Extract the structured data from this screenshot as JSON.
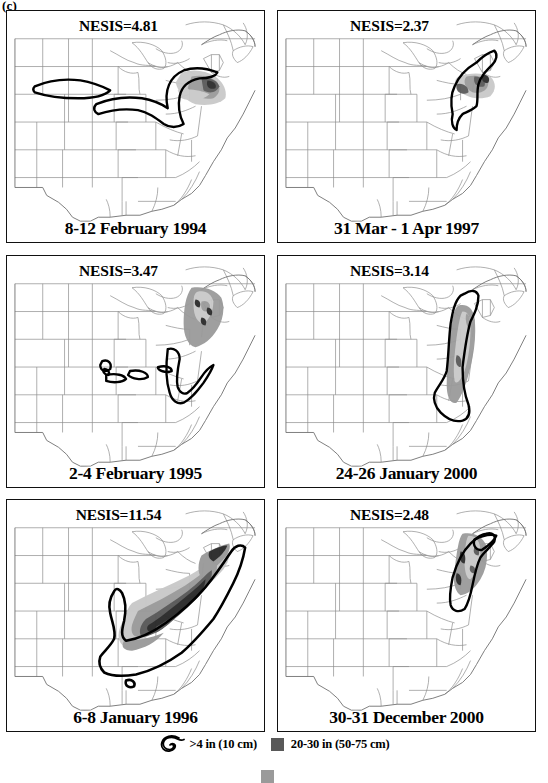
{
  "figure": {
    "panel_label": "(c)"
  },
  "panels": [
    {
      "id": "panel-1994-02",
      "nesis_label": "NESIS=4.81",
      "nesis_value": 4.81,
      "date_label": "8-12 February 1994",
      "row": 0,
      "col": 0
    },
    {
      "id": "panel-1997-03",
      "nesis_label": "NESIS=2.37",
      "nesis_value": 2.37,
      "date_label": "31 Mar - 1 Apr 1997",
      "row": 0,
      "col": 1
    },
    {
      "id": "panel-1995-02",
      "nesis_label": "NESIS=3.47",
      "nesis_value": 3.47,
      "date_label": "2-4 February 1995",
      "row": 1,
      "col": 0
    },
    {
      "id": "panel-2000-01",
      "nesis_label": "NESIS=3.14",
      "nesis_value": 3.14,
      "date_label": "24-26 January 2000",
      "row": 1,
      "col": 1
    },
    {
      "id": "panel-1996-01",
      "nesis_label": "NESIS=11.54",
      "nesis_value": 11.54,
      "date_label": "6-8 January 1996",
      "row": 2,
      "col": 0
    },
    {
      "id": "panel-2000-12",
      "nesis_label": "NESIS=2.48",
      "nesis_value": 2.48,
      "date_label": "30-31 December 2000",
      "row": 2,
      "col": 1
    }
  ],
  "legend": {
    "items": [
      {
        "symbol": "contour-hook",
        "label": ">4 in (10 cm)"
      },
      {
        "symbol": "dark-gray-square",
        "label": "20-30 in (50-75 cm)",
        "color": "#595959"
      }
    ],
    "second_row": {
      "symbol": "gray-square",
      "color": "#9a9a9a",
      "label": ""
    }
  },
  "colors": {
    "border": "#111111",
    "state_outline": "#8c8c8c",
    "contour": "#000000",
    "shade_light": "#c9c9c9",
    "shade_mid": "#9a9a9a",
    "shade_dark": "#595959",
    "shade_darkest": "#2b2b2b",
    "background": "#ffffff"
  }
}
